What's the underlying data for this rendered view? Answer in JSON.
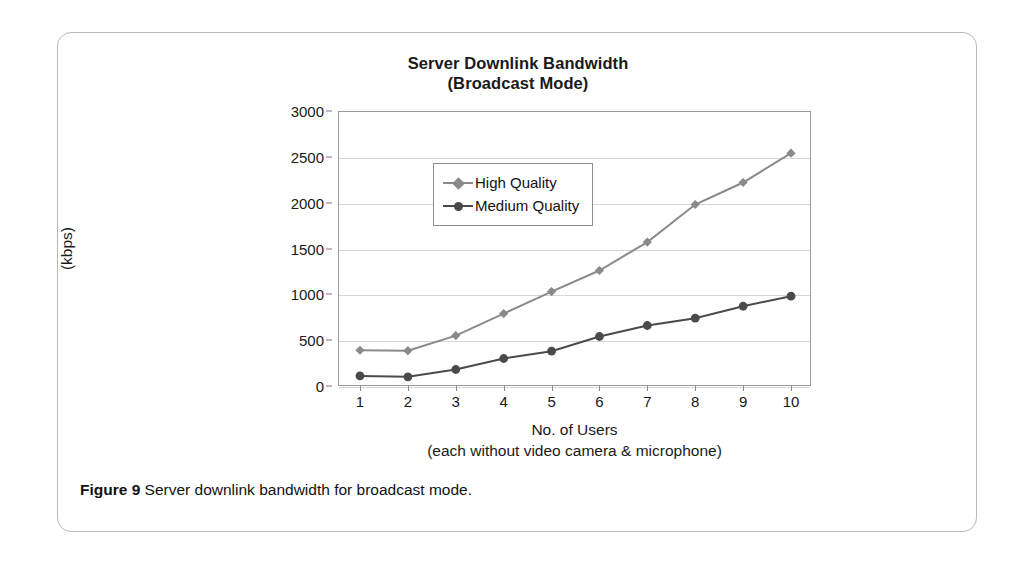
{
  "figure": {
    "caption_label": "Figure 9",
    "caption_text": " Server downlink bandwidth for broadcast mode."
  },
  "chart_data": {
    "type": "line",
    "title": "Server Downlink Bandwidth",
    "subtitle": "(Broadcast Mode)",
    "xlabel": "No. of Users",
    "xlabel_sub": "(each without video camera & microphone)",
    "ylabel": "Server Send Data Rate",
    "ylabel_sub": "(kbps)",
    "x": [
      1,
      2,
      3,
      4,
      5,
      6,
      7,
      8,
      9,
      10
    ],
    "categories": [
      "1",
      "2",
      "3",
      "4",
      "5",
      "6",
      "7",
      "8",
      "9",
      "10"
    ],
    "ylim": [
      0,
      3000
    ],
    "yticks": [
      0,
      500,
      1000,
      1500,
      2000,
      2500,
      3000
    ],
    "ytick_labels": [
      "0",
      "500",
      "1000",
      "1500",
      "2000",
      "2500",
      "3000"
    ],
    "xlim": [
      1,
      10
    ],
    "grid": "horizontal",
    "legend_position": "upper-left-inside",
    "series": [
      {
        "name": "High Quality",
        "marker": "diamond",
        "color": "#8a8a8a",
        "values": [
          390,
          385,
          550,
          790,
          1030,
          1260,
          1570,
          1980,
          2220,
          2540
        ]
      },
      {
        "name": "Medium Quality",
        "marker": "circle",
        "color": "#4a4a4a",
        "values": [
          110,
          100,
          180,
          300,
          380,
          540,
          660,
          740,
          870,
          980
        ]
      }
    ]
  }
}
